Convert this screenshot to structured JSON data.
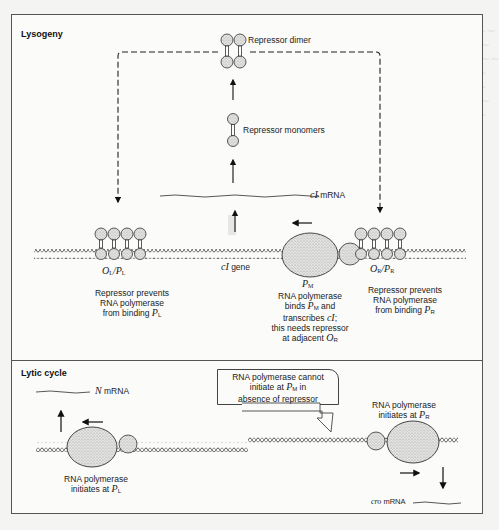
{
  "figure": {
    "panels": [
      {
        "id": "lysogeny",
        "title": "Lysogeny",
        "labels": {
          "repressor_dimer": "Repressor dimer",
          "repressor_monomers": "Repressor monomers",
          "ci_mrna_gene": "cI",
          "ci_mrna_suffix": " mRNA",
          "ci_gene_italic": "cI",
          "ci_gene_suffix": " gene",
          "ol_pl": {
            "o": "O",
            "o_sub": "L",
            "sep": "/",
            "p": "P",
            "p_sub": "L"
          },
          "pm": {
            "p": "P",
            "p_sub": "M"
          },
          "or_pr": {
            "o": "O",
            "o_sub": "R",
            "sep": "/",
            "p": "P",
            "p_sub": "R"
          },
          "left_caption": {
            "line1": "Repressor prevents",
            "line2": "RNA polymerase",
            "line3_prefix": "from binding ",
            "line3_p": "P",
            "line3_sub": "L"
          },
          "middle_caption": {
            "line1": "RNA polymerase",
            "line2_prefix": "binds ",
            "line2_p": "P",
            "line2_sub": "M",
            "line2_suffix": " and",
            "line3_prefix": "transcribes ",
            "line3_ci": "cI",
            "line3_suffix": ";",
            "line4": "this needs repressor",
            "line5_prefix": "at adjacent ",
            "line5_o": "O",
            "line5_sub": "R"
          },
          "right_caption": {
            "line1": "Repressor prevents",
            "line2": "RNA polymerase",
            "line3_prefix": "from binding ",
            "line3_p": "P",
            "line3_sub": "R"
          }
        }
      },
      {
        "id": "lytic",
        "title": "Lytic cycle",
        "labels": {
          "n_mrna_italic": "N",
          "n_mrna_suffix": " mRNA",
          "callout": {
            "line1": "RNA polymerase cannot",
            "line2_prefix": "initiate at ",
            "line2_p": "P",
            "line2_sub": "M",
            "line2_suffix": " in",
            "line3": "absence of repressor"
          },
          "left_caption": {
            "line1": "RNA polymerase",
            "line2_prefix": "initiates at ",
            "line2_p": "P",
            "line2_sub": "L"
          },
          "right_caption": {
            "line1": "RNA polymerase",
            "line2_prefix": "initiates at ",
            "line2_p": "P",
            "line2_sub": "R"
          },
          "cro_mrna_italic": "cro",
          "cro_mrna_suffix": " mRNA"
        }
      }
    ],
    "colors": {
      "line": "#222222",
      "stipple": "#c8c8c8",
      "panel_border": "#555555"
    }
  }
}
